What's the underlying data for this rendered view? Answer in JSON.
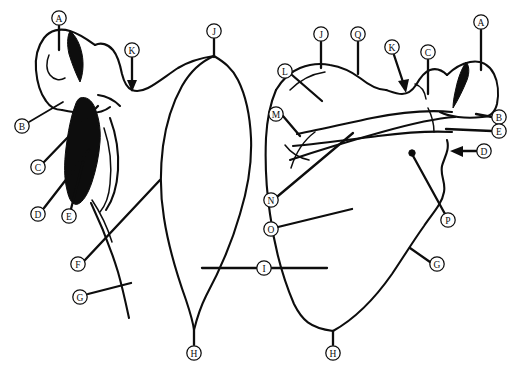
{
  "figure": {
    "background_color": "#ffffff",
    "ink_color": "#0d0d0d",
    "width": 513,
    "height": 372,
    "view_count": 2
  },
  "views": [
    {
      "id": "left-view",
      "name": "costal-anterior-scapula",
      "label": "Left bone outline (anterior / costal surface view)"
    },
    {
      "id": "right-view",
      "name": "dorsal-posterior-scapula",
      "label": "Right bone outline (posterior / dorsal surface view)"
    }
  ],
  "markers": [
    {
      "id": "m-a-left",
      "letter": "A",
      "view": "left-view",
      "cx": 59,
      "cy": 18,
      "tip_x": 59,
      "tip_y": 48,
      "leader": "line",
      "name": "label-marker-a-left"
    },
    {
      "id": "m-b-left",
      "letter": "B",
      "view": "left-view",
      "cx": 22,
      "cy": 126,
      "tip_x": 60,
      "tip_y": 103,
      "leader": "line",
      "name": "label-marker-b-left"
    },
    {
      "id": "m-c-left",
      "letter": "C",
      "view": "left-view",
      "cx": 38,
      "cy": 167,
      "tip_x": 96,
      "tip_y": 107,
      "leader": "line",
      "name": "label-marker-c-left"
    },
    {
      "id": "m-d-left",
      "letter": "D",
      "view": "left-view",
      "cx": 38,
      "cy": 214,
      "tip_x": 88,
      "tip_y": 152,
      "leader": "line",
      "name": "label-marker-d-left"
    },
    {
      "id": "m-e-left",
      "letter": "E",
      "view": "left-view",
      "cx": 69,
      "cy": 216,
      "tip_x": 82,
      "tip_y": 163,
      "leader": "line",
      "name": "label-marker-e-left"
    },
    {
      "id": "m-f-left",
      "letter": "F",
      "view": "left-view",
      "cx": 78,
      "cy": 264,
      "tip_x": 159,
      "tip_y": 180,
      "leader": "line",
      "name": "label-marker-f-left"
    },
    {
      "id": "m-g-left",
      "letter": "G",
      "view": "left-view",
      "cx": 80,
      "cy": 297,
      "tip_x": 129,
      "tip_y": 283,
      "leader": "line",
      "name": "label-marker-g-left"
    },
    {
      "id": "m-h-left",
      "letter": "H",
      "view": "left-view",
      "cx": 194,
      "cy": 353,
      "tip_x": 194,
      "tip_y": 330,
      "leader": "line",
      "name": "label-marker-h-left"
    },
    {
      "id": "m-j-left",
      "letter": "J",
      "view": "left-view",
      "cx": 214,
      "cy": 31,
      "tip_x": 214,
      "tip_y": 56,
      "leader": "line",
      "name": "label-marker-j-left"
    },
    {
      "id": "m-k-left",
      "letter": "K",
      "view": "left-view",
      "cx": 132,
      "cy": 50,
      "tip_x": 132,
      "tip_y": 88,
      "leader": "arrow",
      "name": "label-marker-k-left"
    },
    {
      "id": "m-i-center",
      "letter": "I",
      "view": "left-view",
      "cx": 264,
      "cy": 268,
      "tip_x": 264,
      "tip_y": 268,
      "leader": "span",
      "name": "label-marker-i-center"
    },
    {
      "id": "m-a-right",
      "letter": "A",
      "view": "right-view",
      "cx": 481,
      "cy": 22,
      "tip_x": 481,
      "tip_y": 68,
      "leader": "line",
      "name": "label-marker-a-right"
    },
    {
      "id": "m-b-right",
      "letter": "B",
      "view": "right-view",
      "cx": 499,
      "cy": 117,
      "tip_x": 478,
      "tip_y": 114,
      "leader": "line",
      "name": "label-marker-b-right"
    },
    {
      "id": "m-e-right",
      "letter": "E",
      "view": "right-view",
      "cx": 499,
      "cy": 131,
      "tip_x": 446,
      "tip_y": 128,
      "leader": "line",
      "name": "label-marker-e-right"
    },
    {
      "id": "m-d-right",
      "letter": "D",
      "view": "right-view",
      "cx": 484,
      "cy": 151,
      "tip_x": 452,
      "tip_y": 151,
      "leader": "arrow",
      "name": "label-marker-d-right"
    },
    {
      "id": "m-c-right",
      "letter": "C",
      "view": "right-view",
      "cx": 428,
      "cy": 52,
      "tip_x": 428,
      "tip_y": 92,
      "leader": "line",
      "name": "label-marker-c-right"
    },
    {
      "id": "m-k-right",
      "letter": "K",
      "view": "right-view",
      "cx": 392,
      "cy": 47,
      "tip_x": 404,
      "tip_y": 88,
      "leader": "arrow",
      "name": "label-marker-k-right"
    },
    {
      "id": "m-q-right",
      "letter": "Q",
      "view": "right-view",
      "cx": 358,
      "cy": 34,
      "tip_x": 358,
      "tip_y": 72,
      "leader": "line",
      "name": "label-marker-q-right"
    },
    {
      "id": "m-j-right",
      "letter": "J",
      "view": "right-view",
      "cx": 321,
      "cy": 34,
      "tip_x": 321,
      "tip_y": 66,
      "leader": "line",
      "name": "label-marker-j-right"
    },
    {
      "id": "m-l-right",
      "letter": "L",
      "view": "right-view",
      "cx": 285,
      "cy": 71,
      "tip_x": 320,
      "tip_y": 101,
      "leader": "line",
      "name": "label-marker-l-right"
    },
    {
      "id": "m-m-right",
      "letter": "M",
      "view": "right-view",
      "cx": 276,
      "cy": 114,
      "tip_x": 297,
      "tip_y": 134,
      "leader": "line",
      "name": "label-marker-m-right"
    },
    {
      "id": "m-n-right",
      "letter": "N",
      "view": "right-view",
      "cx": 271,
      "cy": 200,
      "tip_x": 352,
      "tip_y": 132,
      "leader": "line",
      "name": "label-marker-n-right"
    },
    {
      "id": "m-o-right",
      "letter": "O",
      "view": "right-view",
      "cx": 271,
      "cy": 229,
      "tip_x": 351,
      "tip_y": 209,
      "leader": "line",
      "name": "label-marker-o-right"
    },
    {
      "id": "m-p-right",
      "letter": "P",
      "view": "right-view",
      "cx": 448,
      "cy": 220,
      "tip_x": 412,
      "tip_y": 153,
      "leader": "line",
      "name": "label-marker-p-right"
    },
    {
      "id": "m-g-right",
      "letter": "G",
      "view": "right-view",
      "cx": 437,
      "cy": 264,
      "tip_x": 411,
      "tip_y": 248,
      "leader": "line",
      "name": "label-marker-g-right"
    },
    {
      "id": "m-h-right",
      "letter": "H",
      "view": "right-view",
      "cx": 333,
      "cy": 353,
      "tip_x": 333,
      "tip_y": 331,
      "leader": "line",
      "name": "label-marker-h-right"
    }
  ],
  "letters_used": [
    "A",
    "B",
    "C",
    "D",
    "E",
    "F",
    "G",
    "H",
    "I",
    "J",
    "K",
    "L",
    "M",
    "N",
    "O",
    "P",
    "Q"
  ],
  "features": {
    "filled_regions": 3,
    "arrow_leaders": 3,
    "foramen_dot": {
      "cx": 412,
      "cy": 153,
      "r": 3
    }
  }
}
